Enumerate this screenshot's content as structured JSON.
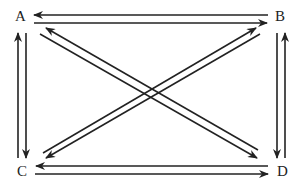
{
  "diagram": {
    "type": "directed-graph",
    "nodes": [
      {
        "id": "A",
        "label": "A",
        "x": 21,
        "y": 21
      },
      {
        "id": "B",
        "label": "B",
        "x": 280,
        "y": 21
      },
      {
        "id": "C",
        "label": "C",
        "x": 22,
        "y": 175
      },
      {
        "id": "D",
        "label": "D",
        "x": 282,
        "y": 175
      }
    ],
    "edges": [
      {
        "from": "B",
        "to": "A"
      },
      {
        "from": "A",
        "to": "B"
      },
      {
        "from": "C",
        "to": "A"
      },
      {
        "from": "A",
        "to": "C"
      },
      {
        "from": "D",
        "to": "B"
      },
      {
        "from": "B",
        "to": "D"
      },
      {
        "from": "D",
        "to": "C"
      },
      {
        "from": "C",
        "to": "D"
      },
      {
        "from": "D",
        "to": "A"
      },
      {
        "from": "A",
        "to": "D"
      },
      {
        "from": "C",
        "to": "B"
      },
      {
        "from": "B",
        "to": "C"
      }
    ]
  }
}
